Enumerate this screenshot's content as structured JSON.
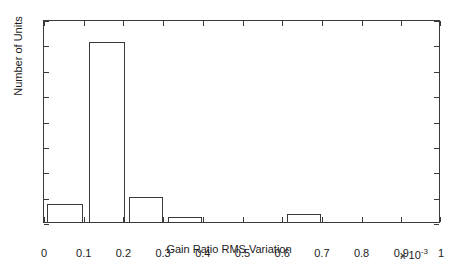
{
  "chart_data": {
    "type": "bar",
    "chart_subtype": "histogram",
    "title": "",
    "xlabel": "Gain Ratio RMS Variation",
    "ylabel": "Number of Units",
    "x_multiplier": "x 10",
    "x_multiplier_exponent": "-3",
    "xlim": [
      0,
      1
    ],
    "ylim": [
      0,
      80
    ],
    "xticks": [
      0,
      0.1,
      0.2,
      0.3,
      0.4,
      0.5,
      0.6,
      0.7,
      0.8,
      0.9,
      1
    ],
    "xtick_labels": [
      "0",
      "0.1",
      "0.2",
      "0.3",
      "0.4",
      "0.5",
      "0.6",
      "0.7",
      "0.8",
      "0.9",
      "1"
    ],
    "yticks": [
      0,
      10,
      20,
      30,
      40,
      50,
      60,
      70,
      80
    ],
    "ytick_labels": [
      "0",
      "10",
      "20",
      "30",
      "40",
      "50",
      "60",
      "70",
      "80"
    ],
    "grid": false,
    "legend": null,
    "bar_fill": "none",
    "bar_edge_color": "#3a3a3a",
    "background_color": "#ffffff",
    "bin_edges": [
      0.008,
      0.098,
      0.113,
      0.203,
      0.215,
      0.3,
      0.313,
      0.398,
      0.613,
      0.698
    ],
    "bins": [
      {
        "start": 0.008,
        "end": 0.098,
        "value": 7
      },
      {
        "start": 0.113,
        "end": 0.203,
        "value": 71
      },
      {
        "start": 0.215,
        "end": 0.3,
        "value": 10
      },
      {
        "start": 0.313,
        "end": 0.398,
        "value": 2
      },
      {
        "start": 0.613,
        "end": 0.698,
        "value": 3
      }
    ],
    "categories": [
      "0.0-0.1",
      "0.1-0.2",
      "0.2-0.3",
      "0.3-0.4",
      "0.6-0.7"
    ],
    "values": [
      7,
      71,
      10,
      2,
      3
    ]
  }
}
